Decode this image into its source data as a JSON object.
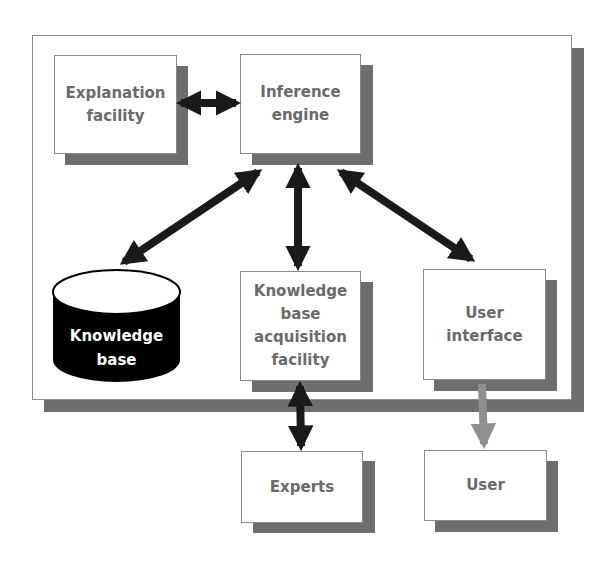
{
  "diagram": {
    "frame": {
      "label": ""
    },
    "nodes": {
      "explanation": {
        "label": "Explanation\nfacility"
      },
      "inference": {
        "label": "Inference\nengine"
      },
      "knowledge_base": {
        "label": "Knowledge\nbase",
        "shape": "cylinder"
      },
      "kb_acquisition": {
        "label": "Knowledge\nbase\nacquisition\nfacility"
      },
      "user_interface": {
        "label": "User\ninterface"
      },
      "experts": {
        "label": "Experts"
      },
      "user": {
        "label": "User"
      }
    },
    "edges": [
      {
        "from": "explanation",
        "to": "inference",
        "direction": "both",
        "color": "#1a1a1a"
      },
      {
        "from": "inference",
        "to": "knowledge_base",
        "direction": "both",
        "color": "#1a1a1a"
      },
      {
        "from": "inference",
        "to": "kb_acquisition",
        "direction": "both",
        "color": "#1a1a1a"
      },
      {
        "from": "inference",
        "to": "user_interface",
        "direction": "both",
        "color": "#1a1a1a"
      },
      {
        "from": "kb_acquisition",
        "to": "experts",
        "direction": "both",
        "color": "#1a1a1a"
      },
      {
        "from": "user_interface",
        "to": "user",
        "direction": "forward",
        "color": "#8f8f8f"
      }
    ],
    "colors": {
      "shadow": "#6e6e6e",
      "border": "#8a8a8a",
      "text": "#6a6a6a",
      "cylinder": "#000000"
    }
  }
}
